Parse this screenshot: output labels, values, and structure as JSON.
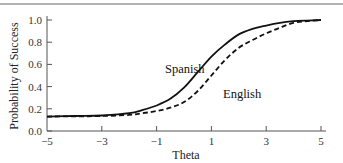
{
  "chart_data": {
    "type": "line",
    "title": "",
    "xlabel": "Theta",
    "ylabel": "Probability of Success",
    "xlim": [
      -5,
      5
    ],
    "ylim": [
      0.0,
      1.0
    ],
    "x_ticks": [
      -5,
      -3,
      -1,
      1,
      3,
      5
    ],
    "x_tick_labels": [
      "−5",
      "−3",
      "−1",
      "1",
      "3",
      "5"
    ],
    "y_ticks": [
      0.0,
      0.2,
      0.4,
      0.6,
      0.8,
      1.0
    ],
    "y_tick_labels": [
      "0.0",
      "0.2",
      "0.4",
      "0.6",
      "0.8",
      "1.0"
    ],
    "grid": false,
    "legend": "inline labels",
    "x": [
      -5,
      -4,
      -3,
      -2,
      -1.5,
      -1,
      -0.5,
      0,
      0.5,
      1,
      1.5,
      2,
      2.5,
      3,
      3.5,
      4,
      4.5,
      5
    ],
    "series": [
      {
        "name": "Spanish",
        "style": "solid",
        "color": "#111111",
        "values": [
          0.13,
          0.135,
          0.14,
          0.16,
          0.19,
          0.23,
          0.29,
          0.39,
          0.53,
          0.67,
          0.78,
          0.87,
          0.92,
          0.95,
          0.975,
          0.99,
          0.995,
          1.0
        ]
      },
      {
        "name": "English",
        "style": "dashed",
        "color": "#111111",
        "values": [
          0.13,
          0.132,
          0.135,
          0.145,
          0.16,
          0.18,
          0.21,
          0.26,
          0.36,
          0.5,
          0.64,
          0.75,
          0.82,
          0.88,
          0.93,
          0.975,
          0.99,
          1.0
        ]
      }
    ],
    "annotations": [
      {
        "text": "Spanish",
        "x": 0.3,
        "y": 0.6
      },
      {
        "text": "English",
        "x": 1.8,
        "y": 0.4
      }
    ]
  },
  "labels": {
    "xlabel": "Theta",
    "ylabel": "Probability of Success",
    "spanish": "Spanish",
    "english": "English"
  }
}
